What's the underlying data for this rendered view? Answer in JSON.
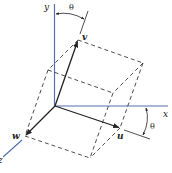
{
  "diagram": {
    "type": "rotated-coordinate-frame",
    "axes": {
      "x_label": "x",
      "y_label": "y",
      "z_label": "z",
      "color": "#5470b0"
    },
    "vectors": {
      "u_label": "u",
      "v_label": "v",
      "w_label": "w",
      "color": "#222222"
    },
    "angles": {
      "top_label": "θ",
      "right_label": "θ"
    },
    "cube": {
      "style": "dashed",
      "color": "#222222"
    }
  }
}
